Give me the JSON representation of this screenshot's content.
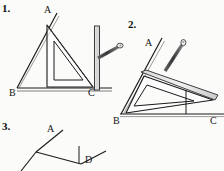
{
  "page": {
    "background_color": "#fbfbfa",
    "ink_color": "#1a1a1a"
  },
  "figures": [
    {
      "id": "figure-1",
      "number_label": "1.",
      "number_pos": {
        "x": 2,
        "y": 4
      },
      "description": "Triangle ABC with a set square placed so its vertical edge stands on BC, a pencil resting against the ruler edge",
      "point_labels": [
        {
          "name": "A",
          "text": "A",
          "x": 44,
          "y": 6
        },
        {
          "name": "B",
          "text": "B",
          "x": 9,
          "y": 89
        },
        {
          "name": "C",
          "text": "C",
          "x": 88,
          "y": 88
        }
      ],
      "triangle": {
        "A": [
          56,
          22
        ],
        "B": [
          18,
          88
        ],
        "C": [
          94,
          88
        ]
      },
      "ray_from_B": [
        [
          17,
          88
        ],
        [
          56,
          14
        ]
      ],
      "set_square": {
        "outer": [
          [
            46,
            26
          ],
          [
            46,
            86
          ],
          [
            92,
            86
          ]
        ],
        "inner": [
          [
            53,
            41
          ],
          [
            53,
            79
          ],
          [
            82,
            79
          ]
        ]
      },
      "ruler": {
        "x": 95,
        "y_top": 27,
        "y_bottom": 90,
        "width": 5
      },
      "pencil": {
        "from": [
          97,
          57
        ],
        "to": [
          122,
          45
        ]
      }
    },
    {
      "id": "figure-2",
      "number_label": "2.",
      "number_pos": {
        "x": 128,
        "y": 20
      },
      "description": "Triangle with set square tilted, its long edge along BA and a perpendicular dropped to BC, pencil along the slanted ruler",
      "point_labels": [
        {
          "name": "A",
          "text": "A",
          "x": 146,
          "y": 40
        },
        {
          "name": "B",
          "text": "B",
          "x": 113,
          "y": 117
        },
        {
          "name": "C",
          "text": "C",
          "x": 211,
          "y": 117
        }
      ],
      "triangle": {
        "A": [
          160,
          48
        ],
        "B": [
          122,
          114
        ],
        "C": [
          222,
          114
        ]
      },
      "ray_from_B": [
        [
          121,
          114
        ],
        [
          161,
          40
        ]
      ],
      "set_square": {
        "outer": [
          [
            127,
            113
          ],
          [
            143,
            77
          ],
          [
            212,
            99
          ]
        ],
        "inner": [
          [
            134,
            105
          ],
          [
            146,
            85
          ],
          [
            193,
            99
          ]
        ]
      },
      "ruler": {
        "from": [
          140,
          74
        ],
        "to": [
          216,
          98
        ],
        "width": 5
      },
      "pencil": {
        "from": [
          164,
          69
        ],
        "to": [
          186,
          39
        ]
      },
      "perpendicular": {
        "from": [
          186,
          90
        ],
        "to": [
          186,
          114
        ]
      }
    },
    {
      "id": "figure-3",
      "number_label": "3.",
      "number_pos": {
        "x": 2,
        "y": 122
      },
      "description": "Partial sketch: ray A crossing a second line, with point D marked by a short perpendicular tick",
      "point_labels": [
        {
          "name": "A",
          "text": "A",
          "x": 47,
          "y": 125
        },
        {
          "name": "D",
          "text": "D",
          "x": 86,
          "y": 155
        }
      ],
      "ray_A": [
        [
          36,
          152
        ],
        [
          62,
          131
        ]
      ],
      "ray_down_left": [
        [
          36,
          152
        ],
        [
          22,
          171
        ]
      ],
      "ray_to_D": [
        [
          36,
          152
        ],
        [
          80,
          163
        ]
      ],
      "ray_past_D": [
        [
          80,
          163
        ],
        [
          104,
          152
        ]
      ],
      "tick_at_D": {
        "from": [
          79,
          147
        ],
        "to": [
          79,
          163
        ]
      }
    }
  ]
}
